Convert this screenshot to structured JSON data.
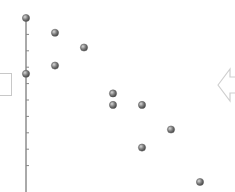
{
  "chart_data": {
    "type": "scatter",
    "title": "",
    "xlabel": "",
    "ylabel": "",
    "xlim": [
      0,
      7
    ],
    "ylim": [
      -0.6,
      10
    ],
    "grid": false,
    "points": [
      {
        "x": 0,
        "y": 10.0
      },
      {
        "x": 1,
        "y": 9.1
      },
      {
        "x": 2,
        "y": 8.2
      },
      {
        "x": 1,
        "y": 7.1
      },
      {
        "x": 0,
        "y": 6.6
      },
      {
        "x": 3,
        "y": 5.4
      },
      {
        "x": 3,
        "y": 4.7
      },
      {
        "x": 4,
        "y": 4.7
      },
      {
        "x": 5,
        "y": 3.2
      },
      {
        "x": 4,
        "y": 2.1
      },
      {
        "x": 6,
        "y": 0.0
      }
    ],
    "y_ticks": [
      1,
      2,
      3,
      4,
      5,
      6,
      7,
      8,
      9,
      10
    ],
    "marker_color": "#7a7a7a",
    "axis_color": "#555555"
  },
  "ui": {
    "side_box_icon": "panel-box",
    "nav_icon": "arrow-left-outline"
  }
}
